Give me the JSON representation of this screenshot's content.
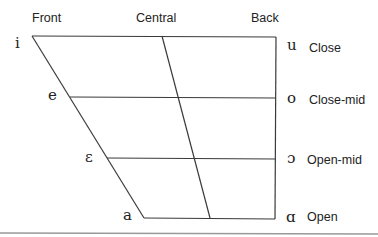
{
  "columns": {
    "front": "Front",
    "central": "Central",
    "back": "Back"
  },
  "front_vowels": {
    "close": "i",
    "close_mid": "e",
    "open_mid": "ɛ",
    "open": "a"
  },
  "back_vowels": {
    "close": "u",
    "close_mid": "o",
    "open_mid": "ɔ",
    "open": "ɑ"
  },
  "heights": {
    "close": "Close",
    "close_mid": "Close-mid",
    "open_mid": "Open-mid",
    "open": "Open"
  },
  "colors": {
    "line": "#3a3a3a",
    "rule": "#999999",
    "text": "#222222"
  }
}
